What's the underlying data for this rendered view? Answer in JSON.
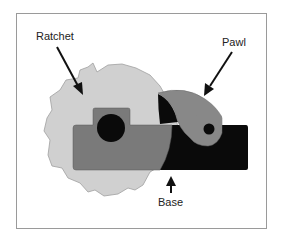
{
  "diagram": {
    "labels": {
      "ratchet": "Ratchet",
      "pawl": "Pawl",
      "base": "Base"
    },
    "colors": {
      "ratchet_fill": "#d0d0d0",
      "ratchet_stroke": "#9a9a9a",
      "base_fill": "#7a7a7a",
      "base_dark": "#0a0a0a",
      "pawl_fill": "#888888",
      "frame_border": "#9a9a9a",
      "arrow": "#111111"
    }
  }
}
